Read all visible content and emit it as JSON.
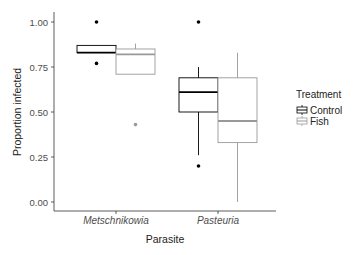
{
  "chart_data": {
    "type": "boxplot",
    "title": "",
    "xlabel": "Parasite",
    "ylabel": "Proportion infected",
    "ylim": [
      0,
      1
    ],
    "yticks": [
      "0.00",
      "0.25",
      "0.50",
      "0.75",
      "1.00"
    ],
    "categories": [
      "Metschnikowia",
      "Pasteuria"
    ],
    "grid": false,
    "legend": {
      "title": "Treatment",
      "position": "right",
      "entries": [
        "Control",
        "Fish"
      ]
    },
    "series": [
      {
        "name": "Control",
        "color": "#000000",
        "boxes": [
          {
            "category": "Metschnikowia",
            "whisker_low": 0.83,
            "q1": 0.83,
            "median": 0.83,
            "q3": 0.87,
            "whisker_high": 0.87,
            "outliers": [
              1.0,
              0.77
            ]
          },
          {
            "category": "Pasteuria",
            "whisker_low": 0.26,
            "q1": 0.5,
            "median": 0.61,
            "q3": 0.69,
            "whisker_high": 0.75,
            "outliers": [
              1.0,
              0.2
            ]
          }
        ]
      },
      {
        "name": "Fish",
        "color": "#999999",
        "boxes": [
          {
            "category": "Metschnikowia",
            "whisker_low": 0.71,
            "q1": 0.71,
            "median": 0.82,
            "q3": 0.85,
            "whisker_high": 0.88,
            "outliers": [
              0.43
            ]
          },
          {
            "category": "Pasteuria",
            "whisker_low": 0.0,
            "q1": 0.33,
            "median": 0.45,
            "q3": 0.69,
            "whisker_high": 0.83,
            "outliers": []
          }
        ]
      }
    ]
  }
}
